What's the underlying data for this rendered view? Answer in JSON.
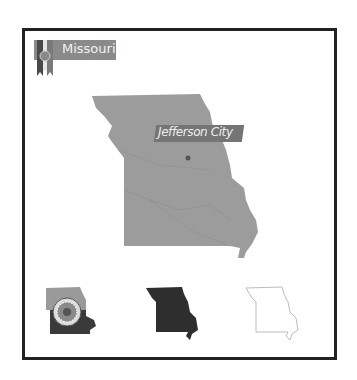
{
  "badge": {
    "state_name": "Missouri",
    "ribbon_color": "#8a8a8a",
    "icon": "state-seal-icon"
  },
  "main_map": {
    "fill_color": "#9a9a9a",
    "capital_label": "Jefferson City",
    "capital_marker": "capital-dot-icon"
  },
  "variants": [
    {
      "name": "flag-map",
      "style": "flag"
    },
    {
      "name": "silhouette-map",
      "fill": "#2e2e2e"
    },
    {
      "name": "outline-map",
      "stroke": "#bbbbbb"
    }
  ],
  "colors": {
    "frame": "#222222",
    "background": "#ffffff"
  }
}
